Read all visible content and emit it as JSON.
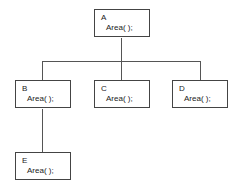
{
  "diagram": {
    "type": "class-hierarchy-tree",
    "nodes": [
      {
        "id": "A",
        "label": "A",
        "method": "Area( );",
        "parent": null
      },
      {
        "id": "B",
        "label": "B",
        "method": "Area( );",
        "parent": "A"
      },
      {
        "id": "C",
        "label": "C",
        "method": "Area( );",
        "parent": "A"
      },
      {
        "id": "D",
        "label": "D",
        "method": "Area( );",
        "parent": "A"
      },
      {
        "id": "E",
        "label": "E",
        "method": "Area( );",
        "parent": "B"
      }
    ],
    "edges": [
      {
        "from": "A",
        "to": "B"
      },
      {
        "from": "A",
        "to": "C"
      },
      {
        "from": "A",
        "to": "D"
      },
      {
        "from": "B",
        "to": "E"
      }
    ]
  }
}
